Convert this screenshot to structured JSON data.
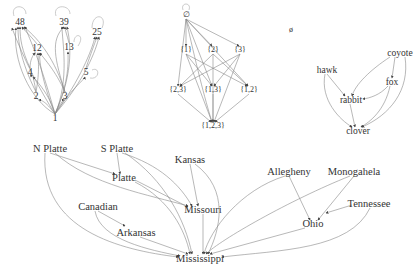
{
  "divisibility_graph": {
    "nodes": [
      {
        "id": "48",
        "label": "48",
        "x": 20,
        "y": 22
      },
      {
        "id": "39",
        "label": "39",
        "x": 64,
        "y": 22
      },
      {
        "id": "25",
        "label": "25",
        "x": 97,
        "y": 32
      },
      {
        "id": "12",
        "label": "12",
        "x": 37,
        "y": 48
      },
      {
        "id": "13",
        "label": "13",
        "x": 69,
        "y": 47
      },
      {
        "id": "4",
        "label": "4",
        "x": 30,
        "y": 72
      },
      {
        "id": "5",
        "label": "5",
        "x": 86,
        "y": 72
      },
      {
        "id": "2",
        "label": "2",
        "x": 36,
        "y": 96
      },
      {
        "id": "3",
        "label": "3",
        "x": 65,
        "y": 96
      },
      {
        "id": "1",
        "label": "1",
        "x": 55,
        "y": 118
      }
    ]
  },
  "powerset_lattice": {
    "nodes": [
      {
        "id": "empty",
        "label": "∅",
        "x": 186,
        "y": 15
      },
      {
        "id": "s1",
        "label": "{1}",
        "x": 186,
        "y": 50
      },
      {
        "id": "s2",
        "label": "{2}",
        "x": 213,
        "y": 50
      },
      {
        "id": "s3",
        "label": "{3}",
        "x": 240,
        "y": 50
      },
      {
        "id": "s23",
        "label": "{2,3}",
        "x": 178,
        "y": 90
      },
      {
        "id": "s13",
        "label": "{1,3}",
        "x": 213,
        "y": 90
      },
      {
        "id": "s12",
        "label": "{1,2}",
        "x": 249,
        "y": 90
      },
      {
        "id": "s123",
        "label": "{1,2,3}",
        "x": 213,
        "y": 126
      }
    ]
  },
  "isolated_node": {
    "label": "ø",
    "x": 291,
    "y": 30
  },
  "food_web": {
    "nodes": [
      {
        "id": "coyote",
        "label": "coyote",
        "x": 400,
        "y": 53
      },
      {
        "id": "hawk",
        "label": "hawk",
        "x": 327,
        "y": 70
      },
      {
        "id": "fox",
        "label": "fox",
        "x": 392,
        "y": 82
      },
      {
        "id": "rabbit",
        "label": "rabbit",
        "x": 351,
        "y": 100
      },
      {
        "id": "clover",
        "label": "clover",
        "x": 358,
        "y": 131
      }
    ]
  },
  "rivers": {
    "nodes": [
      {
        "id": "nplatte",
        "label": "N Platte",
        "x": 50,
        "y": 149
      },
      {
        "id": "splatte",
        "label": "S Platte",
        "x": 117,
        "y": 149
      },
      {
        "id": "kansas",
        "label": "Kansas",
        "x": 190,
        "y": 160
      },
      {
        "id": "platte",
        "label": "Platte",
        "x": 124,
        "y": 178
      },
      {
        "id": "allegheny",
        "label": "Allegheny",
        "x": 289,
        "y": 172
      },
      {
        "id": "monogahela",
        "label": "Monogahela",
        "x": 354,
        "y": 172
      },
      {
        "id": "tennessee",
        "label": "Tennessee",
        "x": 369,
        "y": 204
      },
      {
        "id": "canadian",
        "label": "Canadian",
        "x": 98,
        "y": 207
      },
      {
        "id": "missouri",
        "label": "Missouri",
        "x": 203,
        "y": 210
      },
      {
        "id": "ohio",
        "label": "Ohio",
        "x": 313,
        "y": 224
      },
      {
        "id": "arkansas",
        "label": "Arkansas",
        "x": 136,
        "y": 233
      },
      {
        "id": "mississippi",
        "label": "Mississippi",
        "x": 200,
        "y": 259
      }
    ]
  }
}
